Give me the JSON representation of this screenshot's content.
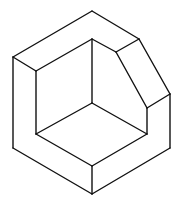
{
  "figure": {
    "stroke_color": "#111111",
    "background": "#ffffff",
    "vertices": {
      "outer_top": [
        92,
        11
      ],
      "outer_upper_left": [
        13,
        57
      ],
      "outer_bottom_left": [
        13,
        148
      ],
      "outer_bottom": [
        92,
        194
      ],
      "outer_bottom_right": [
        170,
        148
      ],
      "outer_right": [
        170,
        94
      ],
      "outer_top_right": [
        139,
        39
      ],
      "inner_top": [
        92,
        39
      ],
      "inner_upper_left": [
        36,
        71
      ],
      "inner_bottom_left": [
        36,
        134
      ],
      "inner_center": [
        92,
        103
      ],
      "inner_bottom": [
        92,
        166
      ],
      "inner_bottom_right": [
        147,
        134
      ],
      "chamfer_inner_top": [
        116,
        52
      ],
      "chamfer_inner_bottom": [
        147,
        108
      ]
    },
    "edges": [
      [
        "outer_top",
        "outer_upper_left"
      ],
      [
        "outer_upper_left",
        "outer_bottom_left"
      ],
      [
        "outer_bottom_left",
        "outer_bottom"
      ],
      [
        "outer_bottom",
        "outer_bottom_right"
      ],
      [
        "outer_bottom_right",
        "outer_right"
      ],
      [
        "outer_right",
        "outer_top_right"
      ],
      [
        "outer_top_right",
        "outer_top"
      ],
      [
        "outer_upper_left",
        "inner_upper_left"
      ],
      [
        "inner_upper_left",
        "inner_top"
      ],
      [
        "inner_top",
        "chamfer_inner_top"
      ],
      [
        "chamfer_inner_top",
        "outer_top_right"
      ],
      [
        "chamfer_inner_top",
        "chamfer_inner_bottom"
      ],
      [
        "chamfer_inner_bottom",
        "outer_right"
      ],
      [
        "chamfer_inner_bottom",
        "inner_bottom_right"
      ],
      [
        "inner_upper_left",
        "inner_bottom_left"
      ],
      [
        "inner_top",
        "inner_center"
      ],
      [
        "inner_center",
        "inner_bottom_left"
      ],
      [
        "inner_center",
        "inner_bottom_right"
      ],
      [
        "inner_bottom_left",
        "inner_bottom"
      ],
      [
        "inner_bottom",
        "inner_bottom_right"
      ],
      [
        "inner_bottom",
        "outer_bottom"
      ]
    ]
  }
}
